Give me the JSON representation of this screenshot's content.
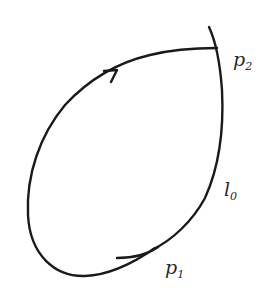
{
  "diagram": {
    "type": "phase-plane trajectory",
    "labels": {
      "p2": {
        "base": "p",
        "sub": "2"
      },
      "p1": {
        "base": "p",
        "sub": "1"
      },
      "l0": {
        "base": "l",
        "sub": "0"
      }
    },
    "arrow_direction": "clockwise (up-right along left arc)",
    "colors": {
      "stroke": "#1a1a1a",
      "text": "#2a2a2a",
      "background": "#ffffff"
    }
  }
}
